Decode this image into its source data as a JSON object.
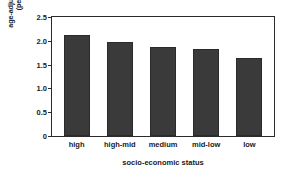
{
  "chart_data": {
    "type": "bar",
    "title": "",
    "categories": [
      "high",
      "high-mid",
      "medium",
      "mid-low",
      "low"
    ],
    "values": [
      2.12,
      1.98,
      1.88,
      1.83,
      1.63
    ],
    "series": [
      {
        "name": "age-adjusted incidence",
        "values": [
          2.12,
          1.98,
          1.88,
          1.83,
          1.63
        ]
      }
    ],
    "xlabel": "socio-economic status",
    "ylabel_line1": "age-adjusted incidence",
    "ylabel_line2": "(per 100,000)",
    "ylabel": "age-adjusted incidence (per 100,000)",
    "ylim": [
      0,
      2.5
    ],
    "yticks": [
      "0",
      "0.5",
      "1.0",
      "1.5",
      "2.0",
      "2.5"
    ],
    "ytick_values": [
      0,
      0.5,
      1.0,
      1.5,
      2.0,
      2.5
    ],
    "grid": false,
    "legend": false,
    "bar_color": "#3a3a3a",
    "frame_color": "#2b2b2b",
    "background_color": "#ffffff"
  }
}
